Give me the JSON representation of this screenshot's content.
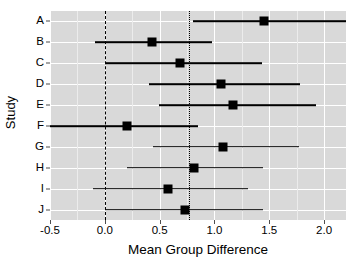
{
  "chart_data": {
    "type": "scatter",
    "subtype": "forest-plot",
    "title": "",
    "xlabel": "Mean Group Difference",
    "ylabel": "Study",
    "xlim": [
      -0.5,
      2.2
    ],
    "ylim_categories": [
      "A",
      "B",
      "C",
      "D",
      "E",
      "F",
      "G",
      "H",
      "I",
      "J"
    ],
    "xticks": [
      -0.5,
      0.0,
      0.5,
      1.0,
      1.5,
      2.0
    ],
    "xticklabels": [
      "-0.5",
      "0.0",
      "0.5",
      "1.0",
      "1.5",
      "2.0"
    ],
    "yticklabels": [
      "A",
      "B",
      "C",
      "D",
      "E",
      "F",
      "G",
      "H",
      "I",
      "J"
    ],
    "grid": "major-white-on-grey",
    "panel_background": "#d9d9d9",
    "grid_color": "#ffffff",
    "marker_color": "#000000",
    "legend": "none",
    "reference_lines": [
      {
        "name": "null-effect",
        "value": 0.0,
        "style": "dashed"
      },
      {
        "name": "pooled-effect",
        "value": 0.77,
        "style": "dotted"
      }
    ],
    "categories": [
      "A",
      "B",
      "C",
      "D",
      "E",
      "F",
      "G",
      "H",
      "I",
      "J"
    ],
    "values": [
      1.45,
      0.43,
      0.69,
      1.06,
      1.17,
      0.2,
      1.08,
      0.81,
      0.58,
      0.73
    ],
    "ci_low": [
      0.8,
      -0.09,
      0.0,
      0.4,
      0.49,
      -0.5,
      0.44,
      0.2,
      -0.11,
      0.0
    ],
    "ci_high": [
      2.27,
      0.98,
      1.43,
      1.78,
      1.93,
      0.85,
      1.77,
      1.44,
      1.31,
      1.44
    ],
    "points": [
      {
        "study": "A",
        "estimate": 1.45,
        "ci_low": 0.8,
        "ci_high": 2.27
      },
      {
        "study": "B",
        "estimate": 0.43,
        "ci_low": -0.09,
        "ci_high": 0.98
      },
      {
        "study": "C",
        "estimate": 0.69,
        "ci_low": 0.0,
        "ci_high": 1.43
      },
      {
        "study": "D",
        "estimate": 1.06,
        "ci_low": 0.4,
        "ci_high": 1.78
      },
      {
        "study": "E",
        "estimate": 1.17,
        "ci_low": 0.49,
        "ci_high": 1.93
      },
      {
        "study": "F",
        "estimate": 0.2,
        "ci_low": -0.5,
        "ci_high": 0.85
      },
      {
        "study": "G",
        "estimate": 1.08,
        "ci_low": 0.44,
        "ci_high": 1.77
      },
      {
        "study": "H",
        "estimate": 0.81,
        "ci_low": 0.2,
        "ci_high": 1.44
      },
      {
        "study": "I",
        "estimate": 0.58,
        "ci_low": -0.11,
        "ci_high": 1.31
      },
      {
        "study": "J",
        "estimate": 0.73,
        "ci_low": 0.0,
        "ci_high": 1.44
      }
    ]
  }
}
